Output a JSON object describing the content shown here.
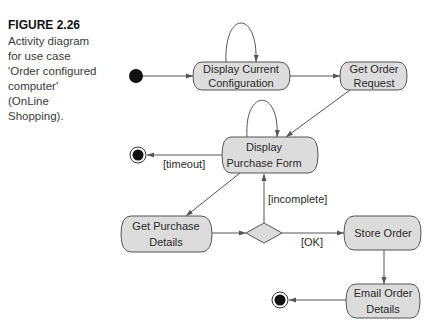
{
  "caption": {
    "figure_label": "FIGURE 2.26",
    "line1": "Activity diagram",
    "line2": "for use case",
    "line3": "'Order configured",
    "line4": "computer'",
    "line5": "(OnLine",
    "line6": "Shopping)."
  },
  "nodes": {
    "display_config": {
      "line1": "Display Current",
      "line2": "Configuration"
    },
    "get_order": {
      "line1": "Get Order",
      "line2": "Request"
    },
    "display_form": {
      "line1": "Display",
      "line2": "Purchase Form"
    },
    "get_purchase": {
      "line1": "Get Purchase",
      "line2": "Details"
    },
    "store_order": {
      "line1": "Store Order"
    },
    "email_order": {
      "line1": "Email Order",
      "line2": "Details"
    }
  },
  "guards": {
    "timeout": "[timeout]",
    "incomplete": "[incomplete]",
    "ok": "[OK]"
  },
  "colors": {
    "node_fill": "#dcdcdc",
    "stroke": "#555555",
    "text": "#2a2a2a"
  }
}
